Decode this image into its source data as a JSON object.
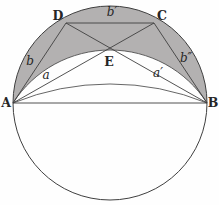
{
  "diagram": {
    "colors": {
      "background": "#fefefe",
      "shade": "#b3b1b1",
      "stroke": "#3f3f3f",
      "text": "#262626"
    },
    "canvas": {
      "width": 219,
      "height": 205
    },
    "circle": {
      "cx": 110,
      "cy": 103,
      "r": 97
    },
    "points": {
      "A": {
        "x": 13,
        "y": 103
      },
      "B": {
        "x": 207,
        "y": 103
      },
      "C": {
        "x": 154,
        "y": 23
      },
      "D": {
        "x": 66,
        "y": 23
      }
    },
    "segments": [
      {
        "id": "segment-A-B",
        "from": "A",
        "to": "B"
      },
      {
        "id": "segment-A-D",
        "from": "A",
        "to": "D"
      },
      {
        "id": "segment-D-C",
        "from": "D",
        "to": "C"
      },
      {
        "id": "segment-C-B",
        "from": "C",
        "to": "B"
      },
      {
        "id": "segment-A-C",
        "from": "A",
        "to": "C"
      },
      {
        "id": "segment-D-B",
        "from": "D",
        "to": "B"
      }
    ],
    "inner_arcs": [
      {
        "id": "inner-arc-through-E",
        "from": "A",
        "to": "B",
        "radius": 115.3
      },
      {
        "id": "inner-arc-shallow",
        "from": "A",
        "to": "B",
        "radius": 257.1
      }
    ],
    "lune": {
      "from": "A",
      "to": "B",
      "outer_radius": 97,
      "inner_radius": 115.3
    },
    "labels": [
      {
        "id": "label-A",
        "text": "A",
        "x": 6,
        "y": 107,
        "kind": "point"
      },
      {
        "id": "label-B",
        "text": "B",
        "x": 213,
        "y": 107,
        "kind": "point"
      },
      {
        "id": "label-C",
        "text": "C",
        "x": 162,
        "y": 20,
        "kind": "point"
      },
      {
        "id": "label-D",
        "text": "D",
        "x": 58,
        "y": 20,
        "kind": "point"
      },
      {
        "id": "label-E",
        "text": "E",
        "x": 109,
        "y": 66,
        "kind": "point"
      },
      {
        "id": "label-a",
        "text": "a",
        "x": 46,
        "y": 79,
        "kind": "measure"
      },
      {
        "id": "label-a-prime",
        "text": "a′",
        "x": 158,
        "y": 77,
        "kind": "measure"
      },
      {
        "id": "label-b",
        "text": "b",
        "x": 30,
        "y": 65,
        "kind": "measure"
      },
      {
        "id": "label-b-prime",
        "text": "b′",
        "x": 112,
        "y": 16,
        "kind": "measure"
      },
      {
        "id": "label-b-double-prime",
        "text": "b″",
        "x": 186,
        "y": 62,
        "kind": "measure"
      }
    ]
  }
}
